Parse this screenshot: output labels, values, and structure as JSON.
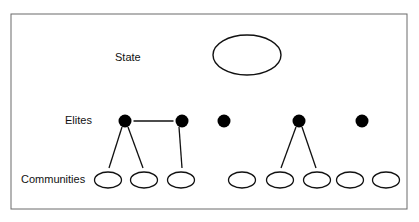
{
  "labels": {
    "state": "State",
    "elites": "Elites",
    "communities": "Communities"
  },
  "colors": {
    "stroke": "#111111",
    "frame": "#6a6a6a",
    "node_fill": "#000000",
    "background": "#ffffff"
  },
  "state_node": {
    "cx": 247,
    "cy": 55,
    "rx": 34,
    "ry": 20
  },
  "elites": [
    {
      "id": "e1",
      "cx": 125,
      "cy": 121
    },
    {
      "id": "e2",
      "cx": 182,
      "cy": 121
    },
    {
      "id": "e3",
      "cx": 224,
      "cy": 121
    },
    {
      "id": "e4",
      "cx": 299,
      "cy": 121
    },
    {
      "id": "e5",
      "cx": 362,
      "cy": 121
    }
  ],
  "communities": [
    {
      "id": "c1",
      "cx": 108,
      "cy": 180
    },
    {
      "id": "c2",
      "cx": 144,
      "cy": 180
    },
    {
      "id": "c3",
      "cx": 181,
      "cy": 180
    },
    {
      "id": "c4",
      "cx": 242,
      "cy": 180
    },
    {
      "id": "c5",
      "cx": 280,
      "cy": 180
    },
    {
      "id": "c6",
      "cx": 317,
      "cy": 180
    },
    {
      "id": "c7",
      "cx": 350,
      "cy": 180
    },
    {
      "id": "c8",
      "cx": 386,
      "cy": 180
    }
  ],
  "edges": [
    {
      "from": "e1",
      "to": "e2"
    },
    {
      "from": "e1",
      "to": "c1"
    },
    {
      "from": "e1",
      "to": "c2"
    },
    {
      "from": "e2",
      "to": "c3"
    },
    {
      "from": "e4",
      "to": "c5"
    },
    {
      "from": "e4",
      "to": "c6"
    }
  ]
}
